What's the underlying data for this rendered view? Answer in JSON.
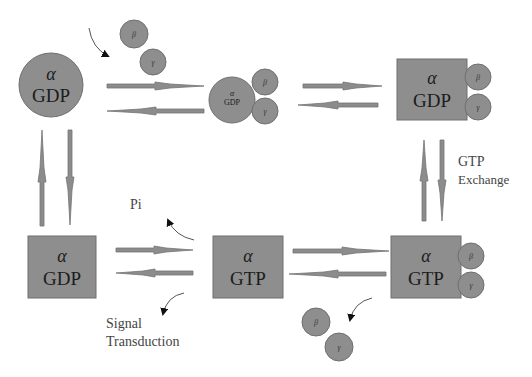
{
  "diagram": {
    "colors": {
      "shape_fill": "#8e8e8e",
      "shape_stroke": "#6f6f6f",
      "arrow_fill": "#8c8c8c",
      "text": "#1c1c1c",
      "label": "#444444"
    },
    "nodes": [
      {
        "id": "n1",
        "shape": "circle",
        "alpha": "α",
        "state": "GDP"
      },
      {
        "id": "n2",
        "shape": "circle",
        "alpha": "α",
        "state": "GDP",
        "subunits": [
          "β",
          "γ"
        ]
      },
      {
        "id": "n3",
        "shape": "square",
        "alpha": "α",
        "state": "GDP",
        "subunits": [
          "β",
          "γ"
        ]
      },
      {
        "id": "n4",
        "shape": "square",
        "alpha": "α",
        "state": "GTP",
        "subunits": [
          "β",
          "γ"
        ]
      },
      {
        "id": "n5",
        "shape": "square",
        "alpha": "α",
        "state": "GTP"
      },
      {
        "id": "n6",
        "shape": "square",
        "alpha": "α",
        "state": "GDP"
      }
    ],
    "free_subunits": {
      "top": [
        "β",
        "γ"
      ],
      "bottom": [
        "β",
        "γ"
      ]
    },
    "labels": {
      "gtp_exchange_line1": "GTP",
      "gtp_exchange_line2": "Exchange",
      "pi": "Pi",
      "signal_line1": "Signal",
      "signal_line2": "Transduction"
    }
  }
}
